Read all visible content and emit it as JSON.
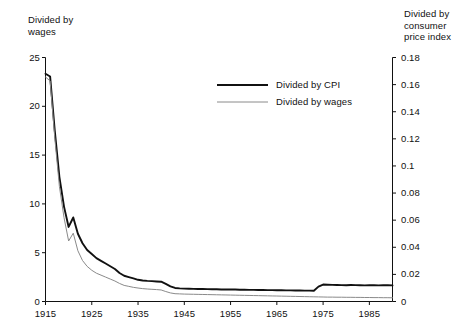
{
  "chart_data": {
    "type": "line",
    "title": "",
    "xlabel": "",
    "ylabel": "Divided by wages",
    "y2label": "Divided by consumer price index",
    "grid": false,
    "legend_position": "upper-center",
    "xlim": [
      1915,
      1990
    ],
    "ylim": [
      0,
      25
    ],
    "y2lim": [
      0,
      0.18
    ],
    "xticks": [
      1915,
      1925,
      1935,
      1945,
      1955,
      1965,
      1975,
      1985
    ],
    "xticklabels": [
      "1915",
      "1925",
      "1935",
      "1945",
      "1955",
      "1965",
      "1975",
      "1985"
    ],
    "yticks": [
      0,
      5,
      10,
      15,
      20,
      25
    ],
    "yticklabels": [
      "0",
      "5",
      "10",
      "15",
      "20",
      "25"
    ],
    "y2ticks": [
      0,
      0.02,
      0.04,
      0.06,
      0.08,
      0.1,
      0.12,
      0.14,
      0.16,
      0.18
    ],
    "y2ticklabels": [
      "0",
      "0.02",
      "0.04",
      "0.06",
      "0.08",
      "0.1",
      "0.12",
      "0.14",
      "0.16",
      "0.18"
    ],
    "series": [
      {
        "name": "Divided by CPI",
        "axis": "right",
        "color": "#111111",
        "width": 1.9,
        "x": [
          1915,
          1916,
          1917,
          1918,
          1919,
          1920,
          1921,
          1922,
          1923,
          1924,
          1925,
          1926,
          1927,
          1928,
          1929,
          1930,
          1931,
          1932,
          1933,
          1934,
          1935,
          1936,
          1937,
          1938,
          1939,
          1940,
          1941,
          1942,
          1943,
          1944,
          1945,
          1946,
          1947,
          1948,
          1949,
          1950,
          1951,
          1952,
          1953,
          1954,
          1955,
          1956,
          1957,
          1958,
          1959,
          1960,
          1961,
          1962,
          1963,
          1964,
          1965,
          1966,
          1967,
          1968,
          1969,
          1970,
          1971,
          1972,
          1973,
          1974,
          1975,
          1976,
          1977,
          1978,
          1979,
          1980,
          1981,
          1982,
          1983,
          1984,
          1985,
          1986,
          1987,
          1988,
          1989,
          1990
        ],
        "y": [
          0.168,
          0.166,
          0.126,
          0.092,
          0.07,
          0.055,
          0.062,
          0.05,
          0.043,
          0.038,
          0.035,
          0.032,
          0.03,
          0.028,
          0.026,
          0.024,
          0.021,
          0.019,
          0.018,
          0.017,
          0.016,
          0.0155,
          0.0152,
          0.015,
          0.0148,
          0.0146,
          0.013,
          0.0112,
          0.01,
          0.0097,
          0.0095,
          0.0094,
          0.0093,
          0.0092,
          0.0092,
          0.0091,
          0.009,
          0.009,
          0.0089,
          0.0089,
          0.0088,
          0.0088,
          0.0087,
          0.0087,
          0.0086,
          0.0086,
          0.0085,
          0.0085,
          0.0084,
          0.0084,
          0.0083,
          0.0083,
          0.0082,
          0.0082,
          0.0081,
          0.0081,
          0.008,
          0.008,
          0.0079,
          0.011,
          0.0125,
          0.0124,
          0.0123,
          0.0122,
          0.0121,
          0.012,
          0.0122,
          0.0121,
          0.012,
          0.0119,
          0.0121,
          0.012,
          0.0119,
          0.0121,
          0.012,
          0.0119
        ]
      },
      {
        "name": "Divided by wages",
        "axis": "left",
        "color": "#8a8a8a",
        "width": 1.0,
        "x": [
          1915,
          1916,
          1917,
          1918,
          1919,
          1920,
          1921,
          1922,
          1923,
          1924,
          1925,
          1926,
          1927,
          1928,
          1929,
          1930,
          1931,
          1932,
          1933,
          1934,
          1935,
          1936,
          1937,
          1938,
          1939,
          1940,
          1941,
          1942,
          1943,
          1944,
          1945,
          1946,
          1947,
          1948,
          1949,
          1950,
          1951,
          1952,
          1953,
          1954,
          1955,
          1956,
          1957,
          1958,
          1959,
          1960,
          1961,
          1962,
          1963,
          1964,
          1965,
          1966,
          1967,
          1968,
          1969,
          1970,
          1971,
          1972,
          1973,
          1974,
          1975,
          1976,
          1977,
          1978,
          1979,
          1980,
          1981,
          1982,
          1983,
          1984,
          1985,
          1986,
          1987,
          1988,
          1989,
          1990
        ],
        "y": [
          23.0,
          22.6,
          16.8,
          11.8,
          8.6,
          6.2,
          7.0,
          5.2,
          4.2,
          3.6,
          3.2,
          2.9,
          2.7,
          2.5,
          2.3,
          2.1,
          1.85,
          1.65,
          1.55,
          1.45,
          1.38,
          1.32,
          1.28,
          1.25,
          1.22,
          1.18,
          1.02,
          0.88,
          0.8,
          0.78,
          0.76,
          0.75,
          0.74,
          0.73,
          0.72,
          0.71,
          0.7,
          0.69,
          0.68,
          0.67,
          0.66,
          0.65,
          0.64,
          0.63,
          0.62,
          0.61,
          0.6,
          0.59,
          0.58,
          0.57,
          0.56,
          0.55,
          0.54,
          0.53,
          0.52,
          0.51,
          0.5,
          0.49,
          0.48,
          0.47,
          0.46,
          0.45,
          0.45,
          0.44,
          0.44,
          0.43,
          0.43,
          0.42,
          0.42,
          0.41,
          0.41,
          0.4,
          0.4,
          0.39,
          0.39,
          0.38
        ]
      }
    ],
    "legend": [
      {
        "label": "Divided by CPI"
      },
      {
        "label": "Divided by wages"
      }
    ]
  },
  "axes": {
    "left_title": "Divided by\nwages",
    "right_title": "Divided by\nconsumer\nprice index"
  }
}
